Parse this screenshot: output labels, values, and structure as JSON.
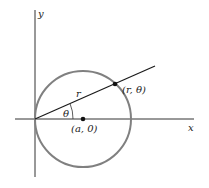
{
  "figure": {
    "axes": {
      "x_label": "x",
      "y_label": "y",
      "origin": [
        35,
        119
      ]
    },
    "circle": {
      "center_label": "(a, 0)",
      "center": [
        83,
        119
      ],
      "radius": 48,
      "stroke_color": "#808080"
    },
    "ray": {
      "length_label": "r",
      "angle_label": "θ",
      "end": [
        155,
        66
      ],
      "color": "#1a1a1a"
    },
    "point": {
      "label": "(r, θ)",
      "position": [
        115,
        84
      ]
    }
  }
}
